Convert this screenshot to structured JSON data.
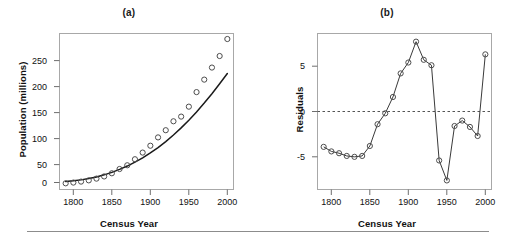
{
  "figure": {
    "bottom_rule": true,
    "frame_color": "#a0a0a0",
    "point_color": "#4d4d4d",
    "line_color": "#1a1a1a",
    "text_color": "#111111"
  },
  "panels": [
    {
      "id": "a",
      "title": "(a)",
      "xlabel": "Census Year",
      "ylabel": "Population (millions)",
      "xticks": [
        "1800",
        "1850",
        "1900",
        "1950",
        "2000"
      ],
      "yticks": [
        "0",
        "50",
        "100",
        "150",
        "200",
        "250"
      ]
    },
    {
      "id": "b",
      "title": "(b)",
      "xlabel": "Census Year",
      "ylabel": "Residuals",
      "xticks": [
        "1800",
        "1850",
        "1900",
        "1950",
        "2000"
      ],
      "yticks": [
        "-5",
        "0",
        "5"
      ]
    }
  ],
  "chart_data": [
    {
      "type": "scatter",
      "panel": "(a)",
      "title": "(a)",
      "xlabel": "Census Year",
      "ylabel": "Population (millions)",
      "xlim": [
        1782,
        2008
      ],
      "ylim": [
        -8,
        292
      ],
      "xticks": [
        1800,
        1850,
        1900,
        1950,
        2000
      ],
      "yticks": [
        0,
        50,
        100,
        150,
        200,
        250
      ],
      "grid": false,
      "legend": false,
      "x": [
        1790,
        1800,
        1810,
        1820,
        1830,
        1840,
        1850,
        1860,
        1870,
        1880,
        1890,
        1900,
        1910,
        1920,
        1930,
        1940,
        1950,
        1960,
        1970,
        1980,
        1990,
        2000
      ],
      "series": [
        {
          "name": "Census population (millions)",
          "marker": "open-circle",
          "values": [
            3.9,
            5.3,
            7.2,
            9.6,
            12.9,
            17.1,
            23.2,
            31.4,
            38.6,
            50.2,
            63.0,
            76.2,
            92.2,
            106.0,
            123.2,
            132.2,
            151.3,
            179.3,
            203.3,
            226.5,
            248.7,
            281.4
          ]
        },
        {
          "name": "Fitted quadratic curve",
          "marker": "line",
          "values": [
            7.5,
            8.7,
            10.5,
            13.0,
            16.2,
            20.2,
            25.0,
            30.6,
            37.1,
            44.5,
            52.9,
            62.3,
            72.7,
            84.2,
            96.8,
            110.5,
            125.3,
            141.2,
            158.2,
            176.3,
            195.4,
            215.0
          ]
        }
      ]
    },
    {
      "type": "line",
      "panel": "(b)",
      "title": "(b)",
      "xlabel": "Census Year",
      "ylabel": "Residuals",
      "xlim": [
        1782,
        2008
      ],
      "ylim": [
        -8.6,
        8.6
      ],
      "xticks": [
        1800,
        1850,
        1900,
        1950,
        2000
      ],
      "yticks": [
        -5,
        0,
        5
      ],
      "grid": false,
      "legend": false,
      "zero_reference_line": 0,
      "x": [
        1790,
        1800,
        1810,
        1820,
        1830,
        1840,
        1850,
        1860,
        1870,
        1880,
        1890,
        1900,
        1910,
        1920,
        1930,
        1940,
        1950,
        1960,
        1970,
        1980,
        1990,
        2000
      ],
      "series": [
        {
          "name": "Residuals",
          "marker": "open-circle-with-line",
          "values": [
            -3.9,
            -4.4,
            -4.6,
            -4.9,
            -5.0,
            -4.9,
            -3.8,
            -1.4,
            -0.2,
            1.6,
            4.2,
            5.4,
            7.7,
            5.7,
            5.1,
            -5.4,
            -7.6,
            -1.6,
            -1.0,
            -1.7,
            -2.7,
            6.3
          ]
        }
      ]
    }
  ]
}
